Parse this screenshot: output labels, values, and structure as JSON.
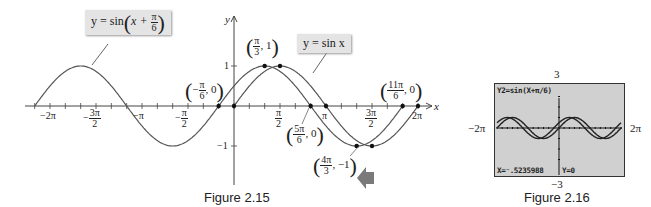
{
  "figure_2_15": {
    "caption": "Figure 2.15",
    "axis_labels": {
      "x": "x",
      "y": "y"
    },
    "y_ticks": [
      {
        "label": "1",
        "value": 1
      },
      {
        "label": "−1",
        "value": -1
      }
    ],
    "x_tick_labels": {
      "neg_2pi": "−2π",
      "neg_3pi_2_num": "3π",
      "neg_3pi_2_den": "2",
      "neg_3pi_2_sign": "−",
      "neg_pi": "−π",
      "neg_pi_2_num": "π",
      "neg_pi_2_den": "2",
      "neg_pi_2_sign": "−",
      "pi_2_num": "π",
      "pi_2_den": "2",
      "pi": "π",
      "3pi_2_num": "3π",
      "3pi_2_den": "2",
      "2pi": "2π"
    },
    "callouts": {
      "shifted": {
        "prefix": "y = sin",
        "inner": "x +",
        "num": "π",
        "den": "6"
      },
      "base": {
        "text": "y = sin x"
      }
    },
    "points": {
      "p1": {
        "sign": "−",
        "num": "π",
        "den": "6",
        "y": "0"
      },
      "p2": {
        "num": "π",
        "den": "3",
        "y": "1"
      },
      "p3": {
        "num": "5π",
        "den": "6",
        "y": "0"
      },
      "p4": {
        "num": "4π",
        "den": "3",
        "y": "−1"
      },
      "p5": {
        "num": "11π",
        "den": "6",
        "y": "0"
      }
    },
    "arrow_color": "#7a7a7a"
  },
  "figure_2_16": {
    "caption": "Figure 2.16",
    "window": {
      "ymax": "3",
      "ymin": "−3",
      "xmin": "−2π",
      "xmax": "2π"
    },
    "screen_title": "Y2=sin(X+π/6)",
    "trace_x": "X=⁻.5235988",
    "trace_y": "Y=0"
  },
  "chart_data": [
    {
      "type": "line",
      "title": "Figure 2.15",
      "xlabel": "x",
      "ylabel": "y",
      "xlim": [
        -6.9,
        6.6
      ],
      "ylim": [
        -1.6,
        2.0
      ],
      "series": [
        {
          "name": "y = sin x",
          "function": "sin(x)"
        },
        {
          "name": "y = sin(x + π/6)",
          "function": "sin(x + pi/6)"
        }
      ],
      "annotations": [
        "(−π/6, 0)",
        "(π/3, 1)",
        "(5π/6, 0)",
        "(4π/3, −1)",
        "(11π/6, 0)"
      ],
      "x_ticks": [
        "−2π",
        "−3π/2",
        "−π",
        "−π/2",
        "π/2",
        "π",
        "3π/2",
        "2π"
      ],
      "y_ticks": [
        1,
        -1
      ]
    },
    {
      "type": "line",
      "title": "Figure 2.16",
      "xlim": [
        "−2π",
        "2π"
      ],
      "ylim": [
        -3,
        3
      ],
      "series": [
        {
          "name": "Y1 = sin(X)",
          "function": "sin(x)"
        },
        {
          "name": "Y2 = sin(X + π/6)",
          "function": "sin(x + pi/6)"
        }
      ],
      "trace": {
        "x": -0.5235988,
        "y": 0
      }
    }
  ]
}
